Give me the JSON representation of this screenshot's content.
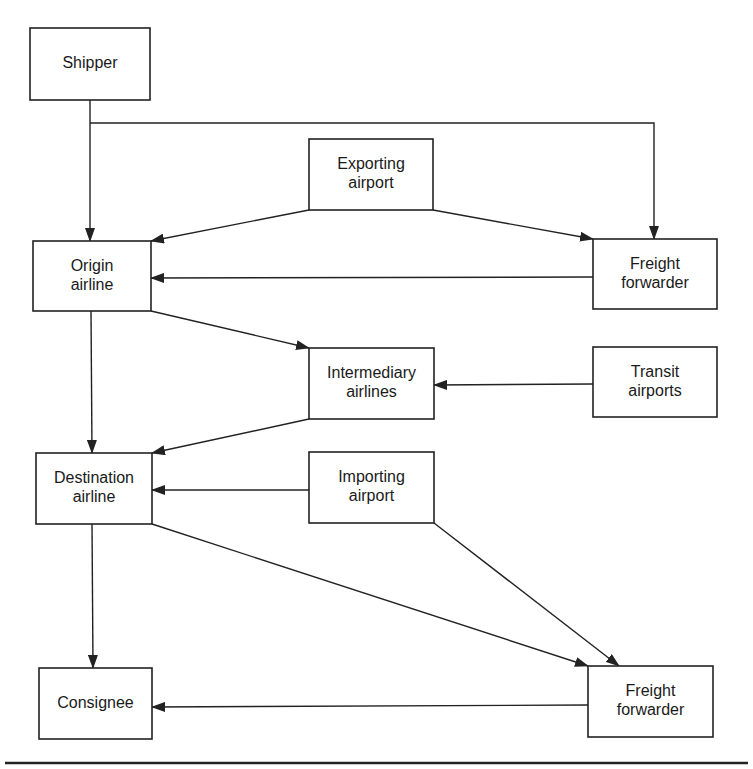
{
  "diagram": {
    "type": "flowchart",
    "nodes": [
      {
        "id": "shipper",
        "lines": [
          "Shipper"
        ],
        "x": 30,
        "y": 28,
        "w": 120,
        "h": 72
      },
      {
        "id": "exporting_airport",
        "lines": [
          "Exporting",
          "airport"
        ],
        "x": 309,
        "y": 139,
        "w": 124,
        "h": 71
      },
      {
        "id": "freight_forwarder_origin",
        "lines": [
          "Freight",
          "forwarder"
        ],
        "x": 593,
        "y": 239,
        "w": 124,
        "h": 70
      },
      {
        "id": "origin_airline",
        "lines": [
          "Origin",
          "airline"
        ],
        "x": 33,
        "y": 241,
        "w": 118,
        "h": 70
      },
      {
        "id": "intermediary_airlines",
        "lines": [
          "Intermediary",
          "airlines"
        ],
        "x": 309,
        "y": 348,
        "w": 125,
        "h": 71
      },
      {
        "id": "transit_airports",
        "lines": [
          "Transit",
          "airports"
        ],
        "x": 593,
        "y": 347,
        "w": 124,
        "h": 70
      },
      {
        "id": "destination_airline",
        "lines": [
          "Destination",
          "airline"
        ],
        "x": 36,
        "y": 453,
        "w": 116,
        "h": 71
      },
      {
        "id": "importing_airport",
        "lines": [
          "Importing",
          "airport"
        ],
        "x": 309,
        "y": 452,
        "w": 125,
        "h": 71
      },
      {
        "id": "consignee",
        "lines": [
          "Consignee"
        ],
        "x": 39,
        "y": 668,
        "w": 113,
        "h": 71
      },
      {
        "id": "freight_forwarder_destination",
        "lines": [
          "Freight",
          "forwarder"
        ],
        "x": 588,
        "y": 666,
        "w": 125,
        "h": 71
      }
    ],
    "edges": [
      {
        "from": "shipper",
        "to": "origin_airline",
        "points": [
          [
            90,
            100
          ],
          [
            90,
            241
          ]
        ]
      },
      {
        "from": "shipper",
        "to": "freight_forwarder_origin",
        "points": [
          [
            90,
            123
          ],
          [
            654,
            123
          ],
          [
            654,
            239
          ]
        ]
      },
      {
        "from": "exporting_airport",
        "to": "origin_airline",
        "points": [
          [
            309,
            210
          ],
          [
            151,
            241
          ]
        ]
      },
      {
        "from": "exporting_airport",
        "to": "freight_forwarder_origin",
        "points": [
          [
            433,
            210
          ],
          [
            593,
            239
          ]
        ]
      },
      {
        "from": "freight_forwarder_origin",
        "to": "origin_airline",
        "points": [
          [
            593,
            277
          ],
          [
            151,
            278
          ]
        ]
      },
      {
        "from": "origin_airline",
        "to": "intermediary_airlines",
        "points": [
          [
            151,
            311
          ],
          [
            309,
            348
          ]
        ]
      },
      {
        "from": "origin_airline",
        "to": "destination_airline",
        "points": [
          [
            91,
            311
          ],
          [
            92,
            453
          ]
        ]
      },
      {
        "from": "transit_airports",
        "to": "intermediary_airlines",
        "points": [
          [
            593,
            384
          ],
          [
            434,
            385
          ]
        ]
      },
      {
        "from": "intermediary_airlines",
        "to": "destination_airline",
        "points": [
          [
            309,
            419
          ],
          [
            152,
            453
          ]
        ]
      },
      {
        "from": "importing_airport",
        "to": "destination_airline",
        "points": [
          [
            309,
            490
          ],
          [
            152,
            490
          ]
        ]
      },
      {
        "from": "destination_airline",
        "to": "consignee",
        "points": [
          [
            92,
            524
          ],
          [
            93,
            668
          ]
        ]
      },
      {
        "from": "destination_airline",
        "to": "freight_forwarder_destination",
        "points": [
          [
            152,
            524
          ],
          [
            588,
            666
          ]
        ]
      },
      {
        "from": "importing_airport",
        "to": "freight_forwarder_destination",
        "points": [
          [
            434,
            523
          ],
          [
            619,
            666
          ]
        ]
      },
      {
        "from": "freight_forwarder_destination",
        "to": "consignee",
        "points": [
          [
            588,
            705
          ],
          [
            152,
            707
          ]
        ]
      }
    ],
    "bottom_rule": {
      "x1": 5,
      "x2": 748,
      "y": 763
    }
  },
  "colors": {
    "stroke": "#222222",
    "text": "#1a1a1a",
    "background": "#ffffff"
  }
}
